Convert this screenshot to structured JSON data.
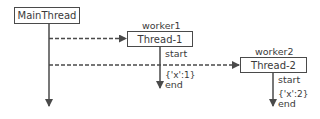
{
  "diagram": {
    "type": "thread-sequence",
    "main_thread": {
      "label": "MainThread"
    },
    "workers": [
      {
        "name": "worker1",
        "thread": "Thread-1",
        "start_label": "start",
        "payload": "{'x':1}",
        "end_label": "end"
      },
      {
        "name": "worker2",
        "thread": "Thread-2",
        "start_label": "start",
        "payload": "{'x':2}",
        "end_label": "end"
      }
    ],
    "colors": {
      "line": "#4a4a4a",
      "text": "#3a3a3a",
      "background": "#ffffff"
    }
  }
}
